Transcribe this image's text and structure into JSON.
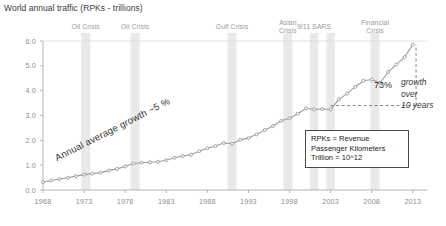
{
  "chart_title": "World annual traffic (RPKs - trillions)",
  "annotations": {
    "trend_label": "Annual average growth ~5 %",
    "growth_pct": "73%",
    "growth_desc": "growth\nover\n10 years",
    "legend_note": "RPKs = Revenue\nPassenger Kilometers\nTrillion = 10^12"
  },
  "colors": {
    "line": "#9d9d9d",
    "marker_fill": "#ffffff",
    "marker_stroke": "#8f8f8f",
    "band": "#e2e2e2",
    "axis": "#b4b4b4",
    "text": "#3a3a3a",
    "tick_text": "#8d8d8d",
    "crisis_text": "#9a9a9a",
    "dashed": "#777777",
    "legend_border": "#4a4a4a"
  },
  "crisis_bands": [
    {
      "label": "Oil Crisis",
      "year": 1973.2,
      "width_years": 1.1
    },
    {
      "label": "Oil Crisis",
      "year": 1979.2,
      "width_years": 1.1
    },
    {
      "label": "Gulf Crisis",
      "year": 1991.0,
      "width_years": 1.1
    },
    {
      "label": "Asian\nCrisis",
      "year": 1997.8,
      "width_years": 1.1
    },
    {
      "label": "9/11 SARS",
      "year": 2001.0,
      "width_years": 1.0
    },
    {
      "label": "",
      "year": 2003.0,
      "width_years": 1.0
    },
    {
      "label": "Financial\nCrisis",
      "year": 2008.4,
      "width_years": 1.1
    }
  ],
  "chart_data": {
    "type": "line",
    "title": "World annual traffic (RPKs - trillions)",
    "xlabel": "",
    "ylabel": "RPKs - trillions",
    "xlim": [
      1968,
      2014
    ],
    "ylim": [
      0.0,
      6.0
    ],
    "grid": false,
    "legend_position": "none",
    "xticks": [
      1968,
      1973,
      1978,
      1983,
      1988,
      1993,
      1998,
      2003,
      2008,
      2013
    ],
    "yticks": [
      0.0,
      1.0,
      2.0,
      3.0,
      4.0,
      5.0,
      6.0
    ],
    "ytick_labels": [
      "0.0",
      "1.0",
      "2.0",
      "3.0",
      "4.0",
      "5.0",
      "6.0"
    ],
    "xtick_labels": [
      "1968",
      "1973",
      "1978",
      "1983",
      "1988",
      "1993",
      "1998",
      "2003",
      "2008",
      "2013"
    ],
    "series": [
      {
        "name": "World annual traffic (RPKs)",
        "x": [
          1968,
          1969,
          1970,
          1971,
          1972,
          1973,
          1974,
          1975,
          1976,
          1977,
          1978,
          1979,
          1980,
          1981,
          1982,
          1983,
          1984,
          1985,
          1986,
          1987,
          1988,
          1989,
          1990,
          1991,
          1992,
          1993,
          1994,
          1995,
          1996,
          1997,
          1998,
          1999,
          2000,
          2001,
          2002,
          2003,
          2004,
          2005,
          2006,
          2007,
          2008,
          2009,
          2010,
          2011,
          2012,
          2013
        ],
        "y": [
          0.32,
          0.38,
          0.44,
          0.49,
          0.56,
          0.62,
          0.66,
          0.7,
          0.78,
          0.85,
          0.95,
          1.07,
          1.1,
          1.12,
          1.14,
          1.2,
          1.3,
          1.37,
          1.42,
          1.56,
          1.68,
          1.77,
          1.89,
          1.86,
          2.02,
          2.09,
          2.24,
          2.42,
          2.58,
          2.79,
          2.89,
          3.07,
          3.29,
          3.24,
          3.26,
          3.24,
          3.65,
          3.88,
          4.15,
          4.4,
          4.45,
          4.31,
          4.75,
          5.05,
          5.35,
          5.85
        ]
      }
    ],
    "reference_lines": {
      "horizontal": {
        "y": 3.4,
        "x_start": 2003,
        "x_end": 2013.6,
        "style": "dashed"
      },
      "vertical": {
        "x": 2013.4,
        "y_start": 3.4,
        "y_end": 5.85,
        "style": "dashed"
      }
    }
  }
}
